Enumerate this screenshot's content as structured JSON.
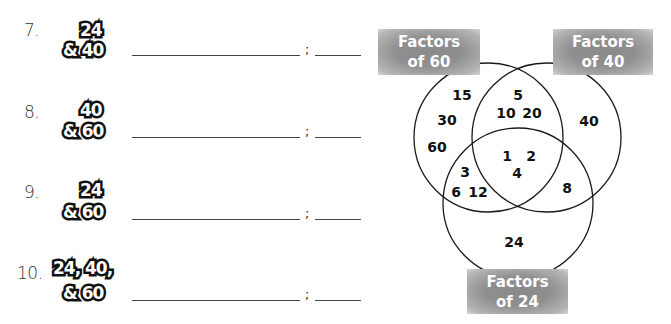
{
  "exercises": [
    {
      "number": "7.",
      "line1": "24",
      "line2": "& 40"
    },
    {
      "number": "8.",
      "line1": "40",
      "line2": "& 60"
    },
    {
      "number": "9.",
      "line1": "24",
      "line2": "& 60"
    },
    {
      "number": "10.",
      "line1": "24, 40,",
      "line2": "& 60"
    }
  ],
  "separator": ";",
  "venn": {
    "labels": {
      "factors_60": {
        "line1": "Factors",
        "line2": "of 60"
      },
      "factors_40": {
        "line1": "Factors",
        "line2": "of 40"
      },
      "factors_24": {
        "line1": "Factors",
        "line2": "of 24"
      }
    },
    "regions": {
      "only_60": [
        "15",
        "30",
        "60"
      ],
      "60_and_40": [
        "5",
        "10",
        "20"
      ],
      "only_40": [
        "40"
      ],
      "all_three": [
        "1",
        "2",
        "4"
      ],
      "60_and_24": [
        "3",
        "6",
        "12"
      ],
      "40_and_24": [
        "8"
      ],
      "only_24": [
        "24"
      ]
    },
    "label_color": "#8c8c8c",
    "line_color": "#1a1a1a"
  }
}
